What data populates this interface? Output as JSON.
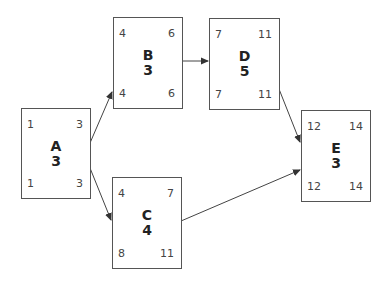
{
  "diagram": {
    "type": "activity-on-node network",
    "nodes": [
      {
        "id": "A",
        "duration": "3",
        "es": "1",
        "ef": "3",
        "ls": "1",
        "lf": "3"
      },
      {
        "id": "B",
        "duration": "3",
        "es": "4",
        "ef": "6",
        "ls": "4",
        "lf": "6"
      },
      {
        "id": "C",
        "duration": "4",
        "es": "4",
        "ef": "7",
        "ls": "8",
        "lf": "11"
      },
      {
        "id": "D",
        "duration": "5",
        "es": "7",
        "ef": "11",
        "ls": "7",
        "lf": "11"
      },
      {
        "id": "E",
        "duration": "3",
        "es": "12",
        "ef": "14",
        "ls": "12",
        "lf": "14"
      }
    ],
    "edges": [
      {
        "from": "A",
        "to": "B"
      },
      {
        "from": "A",
        "to": "C"
      },
      {
        "from": "B",
        "to": "D"
      },
      {
        "from": "D",
        "to": "E"
      },
      {
        "from": "C",
        "to": "E"
      }
    ],
    "colors": {
      "border": "#555555",
      "text": "#333333",
      "arrow": "#333333"
    }
  }
}
